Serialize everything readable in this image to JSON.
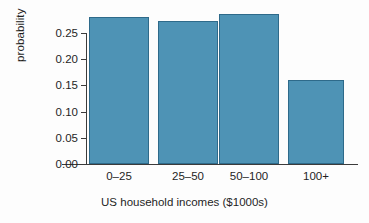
{
  "chart_data": {
    "type": "bar",
    "title": "",
    "xlabel": "US household incomes ($1000s)",
    "ylabel": "probability",
    "categories": [
      "0–25",
      "25–50",
      "50–100",
      "100+"
    ],
    "values": [
      0.28,
      0.273,
      0.286,
      0.16
    ],
    "ylim": [
      0.0,
      0.29
    ],
    "ytick_values": [
      0.0,
      0.05,
      0.1,
      0.15,
      0.2,
      0.25
    ],
    "ytick_labels": [
      "0.00",
      "0.05",
      "0.10",
      "0.15",
      "0.20",
      "0.25"
    ],
    "grid": false,
    "legend": null,
    "bar_color": "#4e93b5",
    "bar_edge_color": "#2e6a8a",
    "axis_color": "#3b3b3b",
    "background_color": "#fdfdfd"
  }
}
